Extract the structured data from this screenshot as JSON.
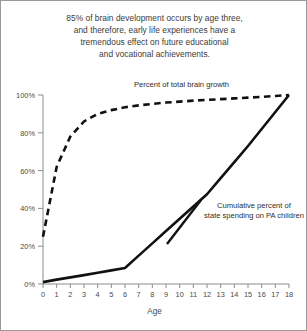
{
  "title": {
    "lines": [
      "85% of brain development occurs by age three,",
      "and therefore, early life experiences have a",
      "tremendous effect on future educational",
      "and vocational achievements."
    ]
  },
  "chart_data": {
    "type": "line",
    "title": "85% of brain development occurs by age three, and therefore, early life experiences have a tremendous effect on future educational and vocational achievements.",
    "xlabel": "Age",
    "ylabel": "",
    "xlim": [
      0,
      18
    ],
    "ylim": [
      0,
      100
    ],
    "grid": false,
    "legend_position": "inline-annotations",
    "x_ticks": [
      "0",
      "1",
      "2",
      "3",
      "4",
      "5",
      "6",
      "7",
      "8",
      "9",
      "10",
      "11",
      "12",
      "13",
      "14",
      "15",
      "16",
      "17",
      "18"
    ],
    "y_ticks": [
      "0%",
      "20%",
      "40%",
      "60%",
      "80%",
      "100%"
    ],
    "x": [
      0,
      1,
      2,
      3,
      4,
      5,
      6,
      7,
      8,
      9,
      10,
      11,
      12,
      13,
      14,
      15,
      16,
      17,
      18
    ],
    "series": [
      {
        "name": "Percent of total brain growth",
        "style": "dashed",
        "color": "#111111",
        "annotation": "Percent of total brain growth",
        "values": [
          25,
          62,
          78,
          86,
          90,
          92,
          93.5,
          94.5,
          95.3,
          96,
          96.5,
          97,
          97.4,
          97.8,
          98.2,
          98.6,
          99,
          99.5,
          100
        ]
      },
      {
        "name": "Cumulative percent of state spending on PA children",
        "style": "solid",
        "color": "#111111",
        "annotation": "Cumulative percent of state spending on PA children",
        "annotation_lines": [
          "Cumulative percent of",
          "state spending on PA children"
        ],
        "values": [
          1,
          2.3,
          3.5,
          4.7,
          6,
          7.2,
          8.5,
          15,
          21.5,
          28,
          34.5,
          41,
          47.5,
          56,
          64.5,
          73,
          82,
          91,
          100
        ]
      }
    ]
  },
  "axis": {
    "x_title": "Age"
  }
}
